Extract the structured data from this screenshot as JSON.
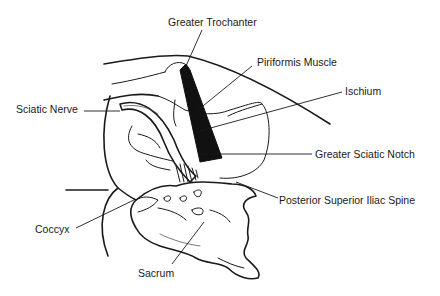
{
  "diagram": {
    "type": "anatomical-illustration",
    "colors": {
      "ink": "#1a1a1a",
      "muscle_fill": "#111111",
      "background": "#ffffff"
    },
    "labels": [
      {
        "id": "greater-trochanter",
        "text": "Greater Trochanter"
      },
      {
        "id": "piriformis-muscle",
        "text": "Piriformis Muscle"
      },
      {
        "id": "ischium",
        "text": "Ischium"
      },
      {
        "id": "sciatic-nerve",
        "text": "Sciatic Nerve"
      },
      {
        "id": "greater-sciatic-notch",
        "text": "Greater Sciatic Notch"
      },
      {
        "id": "posterior-superior-iliac-spine",
        "text": "Posterior Superior Iliac Spine"
      },
      {
        "id": "coccyx",
        "text": "Coccyx"
      },
      {
        "id": "sacrum",
        "text": "Sacrum"
      }
    ]
  }
}
